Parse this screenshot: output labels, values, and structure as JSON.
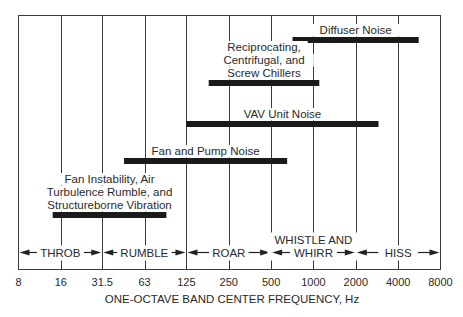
{
  "chart_data": {
    "type": "range-bar",
    "title": "",
    "xlabel": "ONE-OCTAVE BAND CENTER FREQUENCY, Hz",
    "ylabel": "",
    "x_scale": "log2",
    "x_ticks": [
      "8",
      "16",
      "31.5",
      "63",
      "125",
      "250",
      "500",
      "1000",
      "2000",
      "4000",
      "8000"
    ],
    "x_tick_values": [
      8,
      16,
      31.5,
      63,
      125,
      250,
      500,
      1000,
      2000,
      4000,
      8000
    ],
    "xlim": [
      8,
      8000
    ],
    "grid": "vertical lines at each octave band",
    "legend": "none",
    "series": [
      {
        "name": "Diffuser Noise",
        "label_lines": [
          "Diffuser Noise"
        ],
        "start_hz": 710,
        "end_hz": 5600
      },
      {
        "name": "Reciprocating, Centrifugal, and Screw Chillers",
        "label_lines": [
          "Reciprocating,",
          "Centrifugal, and",
          "Screw Chillers"
        ],
        "start_hz": 180,
        "end_hz": 1100
      },
      {
        "name": "VAV Unit Noise",
        "label_lines": [
          "VAV Unit Noise"
        ],
        "start_hz": 125,
        "end_hz": 2900
      },
      {
        "name": "Fan and Pump Noise",
        "label_lines": [
          "Fan and Pump Noise"
        ],
        "start_hz": 45,
        "end_hz": 650
      },
      {
        "name": "Fan Instability, Air Turbulence Rumble, and Structureborne Vibration",
        "label_lines": [
          "Fan Instability, Air",
          "Turbulence Rumble, and",
          "Structureborne Vibration"
        ],
        "start_hz": 14,
        "end_hz": 90
      }
    ],
    "regions": [
      {
        "label_lines": [
          "THROB"
        ],
        "start_hz": 8,
        "end_hz": 31.5
      },
      {
        "label_lines": [
          "RUMBLE"
        ],
        "start_hz": 31.5,
        "end_hz": 125
      },
      {
        "label_lines": [
          "ROAR"
        ],
        "start_hz": 125,
        "end_hz": 500
      },
      {
        "label_lines": [
          "WHISTLE AND",
          "WHIRR"
        ],
        "start_hz": 500,
        "end_hz": 2000
      },
      {
        "label_lines": [
          "HISS"
        ],
        "start_hz": 2000,
        "end_hz": 8000
      }
    ]
  },
  "style": {
    "line_color": "#3a3a3a",
    "bar_color": "#1a1a1a",
    "text_color": "#2a2a2a",
    "background": "#ffffff"
  }
}
